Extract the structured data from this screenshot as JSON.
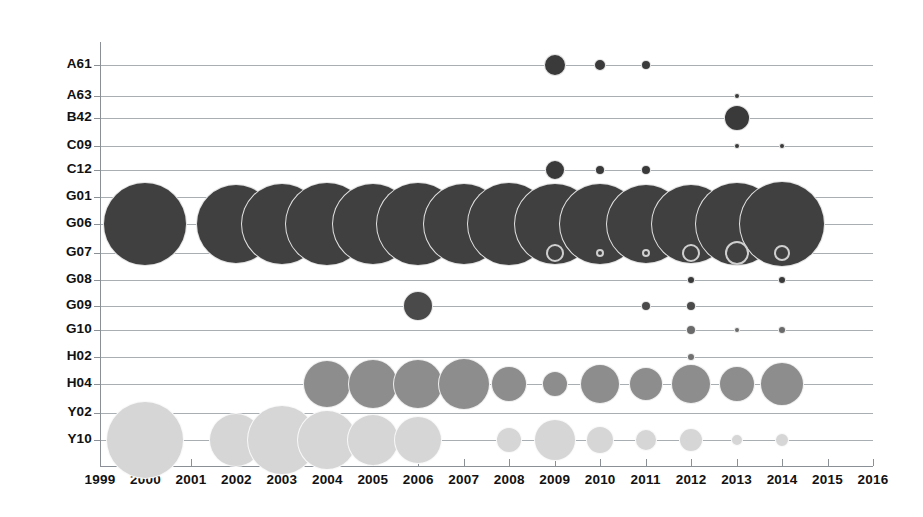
{
  "chart_data": {
    "type": "scatter",
    "title": "",
    "xlabel": "",
    "ylabel": "",
    "grid": true,
    "legend_position": "none",
    "x_tick_labels": [
      "1999",
      "2000",
      "2001",
      "2002",
      "2003",
      "2004",
      "2005",
      "2006",
      "2007",
      "2008",
      "2009",
      "2010",
      "2011",
      "2012",
      "2013",
      "2014",
      "2015",
      "2016"
    ],
    "xlim": [
      1999,
      2016
    ],
    "y_tick_labels": [
      "A61",
      "A63",
      "B42",
      "C09",
      "C12",
      "G01",
      "G06",
      "G07",
      "G08",
      "G09",
      "G10",
      "H02",
      "H04",
      "Y02",
      "Y10"
    ],
    "categories": [
      "A61",
      "A63",
      "B42",
      "C09",
      "C12",
      "G01",
      "G06",
      "G07",
      "G08",
      "G09",
      "G10",
      "H02",
      "H04",
      "Y02",
      "Y10"
    ],
    "bubble_size_units": "radius in pixels",
    "series": [
      {
        "name": "A61",
        "color": "#3a3a3a",
        "style": "filled",
        "points": [
          {
            "x": 2009,
            "r": 11
          },
          {
            "x": 2010,
            "r": 6
          },
          {
            "x": 2011,
            "r": 5
          }
        ]
      },
      {
        "name": "A63",
        "color": "#3a3a3a",
        "style": "filled",
        "points": [
          {
            "x": 2013,
            "r": 3
          }
        ]
      },
      {
        "name": "B42",
        "color": "#3a3a3a",
        "style": "filled",
        "points": [
          {
            "x": 2013,
            "r": 13
          }
        ]
      },
      {
        "name": "C09",
        "color": "#3a3a3a",
        "style": "filled",
        "points": [
          {
            "x": 2013,
            "r": 3
          },
          {
            "x": 2014,
            "r": 3
          }
        ]
      },
      {
        "name": "C12",
        "color": "#3a3a3a",
        "style": "filled",
        "points": [
          {
            "x": 2009,
            "r": 10
          },
          {
            "x": 2010,
            "r": 5
          },
          {
            "x": 2011,
            "r": 5
          }
        ]
      },
      {
        "name": "G06",
        "color": "#404040",
        "style": "filled",
        "points": [
          {
            "x": 2000,
            "r": 42
          },
          {
            "x": 2002,
            "r": 40
          },
          {
            "x": 2003,
            "r": 41
          },
          {
            "x": 2004,
            "r": 42
          },
          {
            "x": 2005,
            "r": 41
          },
          {
            "x": 2006,
            "r": 42
          },
          {
            "x": 2007,
            "r": 41
          },
          {
            "x": 2008,
            "r": 42
          },
          {
            "x": 2009,
            "r": 41
          },
          {
            "x": 2010,
            "r": 41
          },
          {
            "x": 2011,
            "r": 40
          },
          {
            "x": 2012,
            "r": 40
          },
          {
            "x": 2013,
            "r": 42
          },
          {
            "x": 2014,
            "r": 43
          }
        ]
      },
      {
        "name": "G07",
        "color": "#cfcfcf",
        "style": "outline",
        "points": [
          {
            "x": 2009,
            "r": 9
          },
          {
            "x": 2010,
            "r": 4
          },
          {
            "x": 2011,
            "r": 4
          },
          {
            "x": 2012,
            "r": 9
          },
          {
            "x": 2013,
            "r": 12
          },
          {
            "x": 2014,
            "r": 8
          }
        ]
      },
      {
        "name": "G08",
        "color": "#3a3a3a",
        "style": "filled",
        "points": [
          {
            "x": 2012,
            "r": 4
          },
          {
            "x": 2014,
            "r": 4
          }
        ]
      },
      {
        "name": "G09",
        "color": "#4a4a4a",
        "style": "filled",
        "points": [
          {
            "x": 2006,
            "r": 15
          },
          {
            "x": 2011,
            "r": 5
          },
          {
            "x": 2012,
            "r": 5
          }
        ]
      },
      {
        "name": "G10",
        "color": "#6a6a6a",
        "style": "filled",
        "points": [
          {
            "x": 2012,
            "r": 5
          },
          {
            "x": 2013,
            "r": 3
          },
          {
            "x": 2014,
            "r": 4
          }
        ]
      },
      {
        "name": "H02",
        "color": "#707070",
        "style": "filled",
        "points": [
          {
            "x": 2012,
            "r": 4
          }
        ]
      },
      {
        "name": "H04",
        "color": "#8d8d8d",
        "style": "filled",
        "points": [
          {
            "x": 2004,
            "r": 24
          },
          {
            "x": 2005,
            "r": 25
          },
          {
            "x": 2006,
            "r": 25
          },
          {
            "x": 2007,
            "r": 26
          },
          {
            "x": 2008,
            "r": 18
          },
          {
            "x": 2009,
            "r": 13
          },
          {
            "x": 2010,
            "r": 20
          },
          {
            "x": 2011,
            "r": 17
          },
          {
            "x": 2012,
            "r": 20
          },
          {
            "x": 2013,
            "r": 18
          },
          {
            "x": 2014,
            "r": 22
          }
        ]
      },
      {
        "name": "Y10",
        "color": "#d6d6d6",
        "style": "filled",
        "points": [
          {
            "x": 2000,
            "r": 39
          },
          {
            "x": 2002,
            "r": 27
          },
          {
            "x": 2003,
            "r": 35
          },
          {
            "x": 2004,
            "r": 30
          },
          {
            "x": 2005,
            "r": 26
          },
          {
            "x": 2006,
            "r": 24
          },
          {
            "x": 2008,
            "r": 13
          },
          {
            "x": 2009,
            "r": 21
          },
          {
            "x": 2010,
            "r": 14
          },
          {
            "x": 2011,
            "r": 11
          },
          {
            "x": 2012,
            "r": 12
          },
          {
            "x": 2013,
            "r": 6
          },
          {
            "x": 2014,
            "r": 7
          }
        ]
      }
    ]
  },
  "geometry": {
    "plot_left": 100,
    "plot_right": 873,
    "x_start_year": 1999,
    "x_end_year": 2016,
    "row_y": {
      "A61": 65,
      "A63": 96,
      "B42": 118,
      "C09": 146,
      "C12": 170,
      "G01": 197,
      "G06": 224,
      "G07": 253,
      "G08": 280,
      "G09": 306,
      "G10": 330,
      "H02": 357,
      "H04": 384,
      "Y02": 413,
      "Y10": 440
    },
    "axis_bottom": 466,
    "x_label_y": 472
  }
}
